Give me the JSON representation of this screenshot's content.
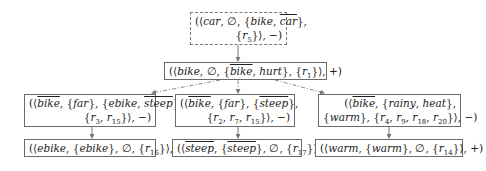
{
  "diagram": {
    "nodes": [
      {
        "id": "root",
        "style": "dashed",
        "lines": [
          [
            {
              "t": "(⟨",
              "u": 1
            },
            {
              "t": "car"
            },
            {
              "t": ", ∅, {",
              "u": 1
            },
            {
              "t": "bike"
            },
            {
              "t": ", ",
              "u": 1
            },
            {
              "t": "car",
              "o": 1
            },
            {
              "t": "},",
              "u": 1
            }
          ],
          [
            {
              "t": "{",
              "u": 1
            },
            {
              "t": "r"
            },
            {
              "s": "5"
            },
            {
              "t": "}⟩, −)",
              "u": 1
            }
          ]
        ]
      },
      {
        "id": "bike",
        "style": "solid",
        "lines": [
          [
            {
              "t": "(⟨",
              "u": 1
            },
            {
              "t": "bike"
            },
            {
              "t": ", ∅, {",
              "u": 1
            },
            {
              "t": "bike",
              "o": 1
            },
            {
              "t": ", ",
              "u": 1
            },
            {
              "t": "hurt"
            },
            {
              "t": "}, {",
              "u": 1
            },
            {
              "t": "r"
            },
            {
              "s": "1"
            },
            {
              "t": "}⟩, +)",
              "u": 1
            }
          ]
        ]
      },
      {
        "id": "ebike-rule",
        "style": "solid",
        "lines": [
          [
            {
              "t": "(⟨",
              "u": 1
            },
            {
              "t": "bike",
              "o": 1
            },
            {
              "t": ", {",
              "u": 1
            },
            {
              "t": "far"
            },
            {
              "t": "}, {",
              "u": 1
            },
            {
              "t": "ebike"
            },
            {
              "t": ", ",
              "u": 1
            },
            {
              "t": "steep",
              "o": 1
            },
            {
              "t": "},",
              "u": 1
            }
          ],
          [
            {
              "t": "{",
              "u": 1
            },
            {
              "t": "r"
            },
            {
              "s": "3"
            },
            {
              "t": ", ",
              "u": 1
            },
            {
              "t": "r"
            },
            {
              "s": "15"
            },
            {
              "t": "}⟩, −)",
              "u": 1
            }
          ]
        ]
      },
      {
        "id": "steep-rule",
        "style": "solid",
        "lines": [
          [
            {
              "t": "(⟨",
              "u": 1
            },
            {
              "t": "bike",
              "o": 1
            },
            {
              "t": ", {",
              "u": 1
            },
            {
              "t": "far"
            },
            {
              "t": "}, {",
              "u": 1
            },
            {
              "t": "steep",
              "o": 1
            },
            {
              "t": "},",
              "u": 1
            }
          ],
          [
            {
              "t": "{",
              "u": 1
            },
            {
              "t": "r"
            },
            {
              "s": "2"
            },
            {
              "t": ", ",
              "u": 1
            },
            {
              "t": "r"
            },
            {
              "s": "7"
            },
            {
              "t": ", ",
              "u": 1
            },
            {
              "t": "r"
            },
            {
              "s": "15"
            },
            {
              "t": "}⟩, −)",
              "u": 1
            }
          ]
        ]
      },
      {
        "id": "warm-rule",
        "style": "solid",
        "lines": [
          [
            {
              "t": "(⟨",
              "u": 1
            },
            {
              "t": "bike",
              "o": 1
            },
            {
              "t": ", {",
              "u": 1
            },
            {
              "t": "rainy"
            },
            {
              "t": ", ",
              "u": 1
            },
            {
              "t": "heat"
            },
            {
              "t": "},",
              "u": 1
            }
          ],
          [
            {
              "t": "{",
              "u": 1
            },
            {
              "t": "warm"
            },
            {
              "t": "}, {",
              "u": 1
            },
            {
              "t": "r"
            },
            {
              "s": "4"
            },
            {
              "t": ", ",
              "u": 1
            },
            {
              "t": "r"
            },
            {
              "s": "9"
            },
            {
              "t": ", ",
              "u": 1
            },
            {
              "t": "r"
            },
            {
              "s": "18"
            },
            {
              "t": ", ",
              "u": 1
            },
            {
              "t": "r"
            },
            {
              "s": "20"
            },
            {
              "t": "}⟩, −)",
              "u": 1
            }
          ]
        ]
      },
      {
        "id": "ebike",
        "style": "solid",
        "lines": [
          [
            {
              "t": "(⟨",
              "u": 1
            },
            {
              "t": "ebike"
            },
            {
              "t": ", {",
              "u": 1
            },
            {
              "t": "ebike"
            },
            {
              "t": "}, ∅, {",
              "u": 1
            },
            {
              "t": "r"
            },
            {
              "s": "16"
            },
            {
              "t": "}⟩, +)",
              "u": 1
            }
          ]
        ]
      },
      {
        "id": "steep",
        "style": "solid",
        "lines": [
          [
            {
              "t": "(⟨",
              "u": 1
            },
            {
              "t": "steep",
              "o": 1
            },
            {
              "t": ", {",
              "u": 1
            },
            {
              "t": "steep",
              "o": 1
            },
            {
              "t": "}, ∅, {",
              "u": 1
            },
            {
              "t": "r"
            },
            {
              "s": "17"
            },
            {
              "t": "}⟩, +)",
              "u": 1
            }
          ]
        ]
      },
      {
        "id": "warm",
        "style": "solid",
        "lines": [
          [
            {
              "t": "(⟨",
              "u": 1
            },
            {
              "t": "warm"
            },
            {
              "t": ", {",
              "u": 1
            },
            {
              "t": "warm"
            },
            {
              "t": "}, ∅, {",
              "u": 1
            },
            {
              "t": "r"
            },
            {
              "s": "14"
            },
            {
              "t": "}⟩, +)",
              "u": 1
            }
          ]
        ]
      }
    ],
    "edges": [
      {
        "from": "root",
        "to": "bike",
        "style": "solid"
      },
      {
        "from": "bike",
        "to": "ebike-rule",
        "style": "dash-dot"
      },
      {
        "from": "bike",
        "to": "steep-rule",
        "style": "dash-dot"
      },
      {
        "from": "bike",
        "to": "warm-rule",
        "style": "dash-dot"
      },
      {
        "from": "ebike-rule",
        "to": "ebike",
        "style": "solid"
      },
      {
        "from": "steep-rule",
        "to": "steep",
        "style": "solid"
      },
      {
        "from": "warm-rule",
        "to": "warm",
        "style": "solid"
      }
    ],
    "colors": {
      "border": "#6a6a6a",
      "edge": "#777777",
      "text": "#222222"
    }
  }
}
